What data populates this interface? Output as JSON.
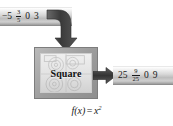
{
  "figure": {
    "caption_formula": {
      "lhs": "f(x)",
      "operator": "=",
      "base": "x",
      "exponent": "2",
      "full": "f(x) = x²"
    }
  },
  "machine": {
    "label": "Square",
    "art_name": "gears-illustration"
  },
  "input": {
    "bar_name": "input-values-bar",
    "values": [
      {
        "kind": "number",
        "text": "−5"
      },
      {
        "kind": "fraction",
        "numerator": "3",
        "denominator": "5"
      },
      {
        "kind": "number",
        "text": "0"
      },
      {
        "kind": "number",
        "text": "3"
      }
    ]
  },
  "output": {
    "bar_name": "output-values-bar",
    "values": [
      {
        "kind": "number",
        "text": "25"
      },
      {
        "kind": "fraction",
        "numerator": "9",
        "denominator": "25"
      },
      {
        "kind": "number",
        "text": "0"
      },
      {
        "kind": "number",
        "text": "9"
      }
    ]
  },
  "arrows": {
    "input_to_machine": "curved-down-arrow",
    "machine_to_output": "right-arrow"
  },
  "colors": {
    "background": "#ffffff",
    "bar_light": "#f2f2f2",
    "bar_dark": "#9c9c9c",
    "box_frame": "#9d9d9d",
    "box_face": "#e2e2e2",
    "arrow": "#3f3f3f",
    "text": "#1a1a1a"
  }
}
